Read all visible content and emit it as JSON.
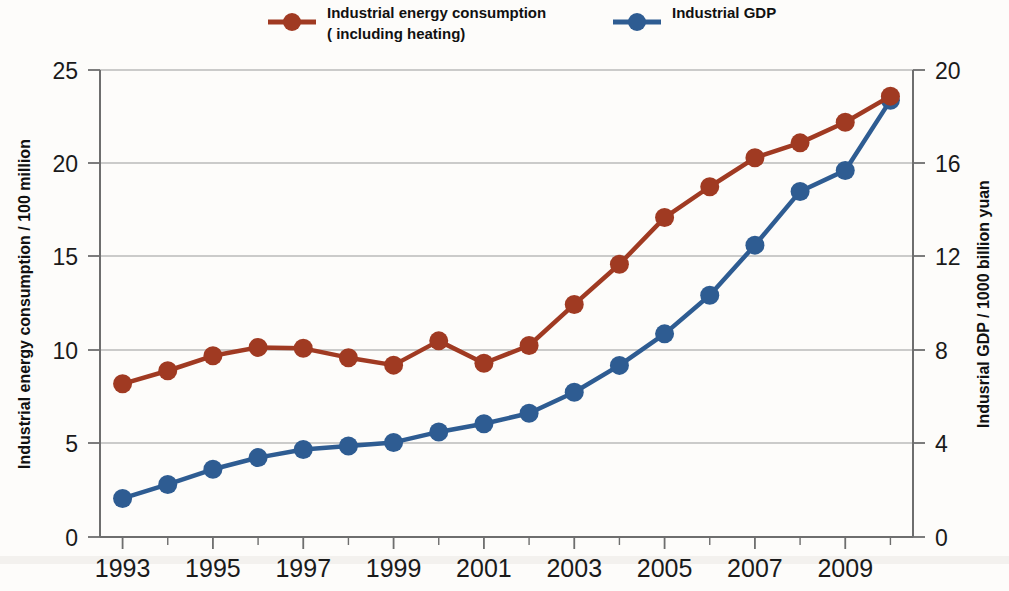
{
  "chart_data": {
    "type": "line",
    "title": "",
    "xlabel": "",
    "ylabel": "Industrial energy consumption  /  100 million",
    "y2label": "Indusrial GDP / 1000 billion yuan",
    "grid": true,
    "legend_position": "top",
    "x": [
      1993,
      1994,
      1995,
      1996,
      1997,
      1998,
      1999,
      2000,
      2001,
      2002,
      2003,
      2004,
      2005,
      2006,
      2007,
      2008,
      2009,
      2010
    ],
    "xtick_labels": [
      "1993",
      "1995",
      "1997",
      "1999",
      "2001",
      "2003",
      "2005",
      "2007",
      "2009"
    ],
    "xtick_values": [
      1993,
      1995,
      1997,
      1999,
      2001,
      2003,
      2005,
      2007,
      2009
    ],
    "xlim": [
      1992.5,
      2010.5
    ],
    "ylim": [
      0,
      25
    ],
    "ytick_labels": [
      "0",
      "5",
      "10",
      "15",
      "20",
      "25"
    ],
    "ytick_values": [
      0,
      5,
      10,
      15,
      20,
      25
    ],
    "y2lim": [
      0,
      20
    ],
    "y2tick_labels": [
      "0",
      "4",
      "8",
      "12",
      "16",
      "20"
    ],
    "y2tick_values": [
      0,
      4,
      8,
      12,
      16,
      20
    ],
    "series": [
      {
        "name": "Industrial energy consumption ( including heating)",
        "axis": "left",
        "color": "#A03A22",
        "marker": "circle",
        "values": [
          8.2,
          8.9,
          9.7,
          10.15,
          10.1,
          9.6,
          9.2,
          10.5,
          9.3,
          10.25,
          12.45,
          14.6,
          17.1,
          18.75,
          20.3,
          21.1,
          22.2,
          23.6
        ]
      },
      {
        "name": "Industrial GDP",
        "axis": "right",
        "color": "#2E5C92",
        "marker": "circle",
        "values": [
          1.65,
          2.25,
          2.9,
          3.4,
          3.75,
          3.9,
          4.05,
          4.5,
          4.85,
          5.3,
          6.2,
          7.35,
          8.7,
          10.35,
          12.5,
          14.8,
          15.7,
          18.7
        ]
      }
    ]
  },
  "legend": {
    "items": [
      {
        "label_line1": "Industrial energy consumption",
        "label_line2": "( including heating)",
        "color": "#A03A22"
      },
      {
        "label_line1": "Industrial GDP",
        "label_line2": "",
        "color": "#2E5C92"
      }
    ]
  },
  "axes": {
    "left_title": "Industrial energy consumption  /  100 million",
    "right_title": "Indusrial GDP / 1000 billion yuan"
  }
}
